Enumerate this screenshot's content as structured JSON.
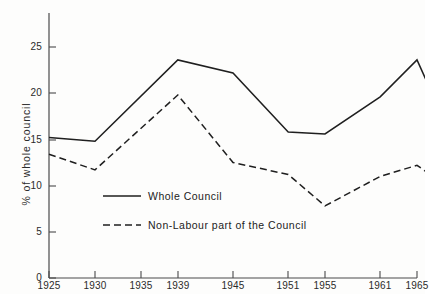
{
  "axes": {
    "y_title": "% of whole council",
    "y_ticks": [
      "0",
      "5",
      "10",
      "15",
      "20",
      "25"
    ],
    "x_ticks": [
      "1925",
      "1930",
      "1935",
      "1939",
      "1945",
      "1951",
      "1955",
      "1961",
      "1965"
    ]
  },
  "legend": {
    "items": [
      {
        "label": "Whole Council",
        "style": "solid"
      },
      {
        "label": "Non-Labour part of the Council",
        "style": "dashed"
      }
    ]
  },
  "colors": {
    "line": "#1f1f1f",
    "axis": "#4a4a4a",
    "background": "#fdfdfc"
  },
  "chart_data": {
    "type": "line",
    "title": "",
    "subtitle": "",
    "xlabel": "",
    "ylabel": "% of whole council",
    "xlim": [
      1925,
      1967
    ],
    "ylim": [
      0,
      27
    ],
    "ytick_values": [
      0,
      5,
      10,
      15,
      20,
      25
    ],
    "xtick_values": [
      1925,
      1930,
      1935,
      1939,
      1945,
      1951,
      1955,
      1961,
      1965
    ],
    "grid": false,
    "legend_position": "inside-lower-left",
    "x": [
      1925,
      1930,
      1939,
      1945,
      1951,
      1955,
      1961,
      1965,
      1967
    ],
    "series": [
      {
        "name": "Whole Council",
        "style": "solid",
        "values": [
          15.2,
          14.8,
          23.6,
          22.2,
          15.8,
          15.6,
          19.6,
          23.6,
          19.2
        ]
      },
      {
        "name": "Non-Labour part of the Council",
        "style": "dashed",
        "values": [
          13.4,
          11.7,
          19.8,
          12.5,
          11.2,
          7.8,
          11.0,
          12.2,
          10.8
        ]
      }
    ]
  }
}
